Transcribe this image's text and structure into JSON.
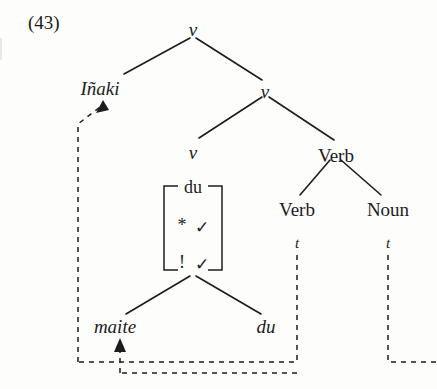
{
  "example": {
    "number": "(43)"
  },
  "tree": {
    "nodes": {
      "root_v": "v",
      "subj": "Iñaki",
      "mid_v": "v",
      "low_v": "v",
      "verb_upper": "Verb",
      "verb_lower": "Verb",
      "noun": "Noun",
      "trace_verb": "t",
      "trace_noun": "t",
      "word_maite": "maite",
      "word_du": "du"
    },
    "feature_matrix": {
      "head": "du",
      "rows": [
        {
          "diacritic": "*",
          "value": "✓"
        },
        {
          "diacritic": "!",
          "value": "✓"
        }
      ]
    }
  },
  "colors": {
    "ink": "#1c1c1c",
    "page": "#fdfdfc"
  }
}
